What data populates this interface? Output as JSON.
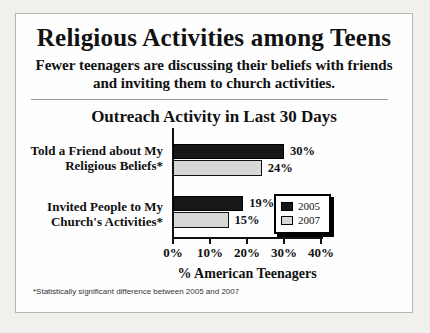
{
  "header": {
    "title": "Religious Activities among Teens",
    "subtitle_line1": "Fewer teenagers are discussing their beliefs with friends",
    "subtitle_line2": "and inviting them to church activities."
  },
  "chart_data": {
    "type": "bar",
    "orientation": "horizontal",
    "title": "Outreach Activity in Last 30 Days",
    "xlabel": "% American Teenagers",
    "categories": [
      [
        "Told a Friend about My",
        "Religious Beliefs*"
      ],
      [
        "Invited People to My",
        "Church's Activities*"
      ]
    ],
    "series": [
      {
        "name": "2005",
        "color": "#171717",
        "values": [
          30,
          19
        ]
      },
      {
        "name": "2007",
        "color": "#d7d7d7",
        "values": [
          24,
          15
        ]
      }
    ],
    "value_label_suffix": "%",
    "xlim": [
      0,
      40
    ],
    "xticks": [
      {
        "value": 0,
        "label": "0%"
      },
      {
        "value": 10,
        "label": "10%"
      },
      {
        "value": 20,
        "label": "20%"
      },
      {
        "value": 30,
        "label": "30%"
      },
      {
        "value": 40,
        "label": "40%"
      }
    ],
    "legend": [
      "2005",
      "2007"
    ],
    "legend_position": "right",
    "grid": false
  },
  "footnote": "*Statistically significant difference between 2005 and 2007",
  "colors": {
    "background": "#f1f0ec",
    "card": "#fefefe",
    "card_border": "#b5b5b2",
    "bar_2005": "#171717",
    "bar_2007": "#d7d7d7",
    "text": "#111111"
  }
}
